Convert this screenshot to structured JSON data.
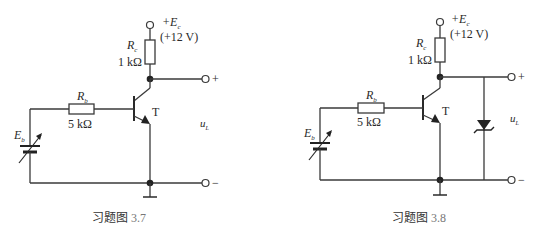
{
  "figures": [
    {
      "id": "3.7",
      "caption_prefix": "习题图",
      "caption_number": "3.7",
      "supply_label": "+E",
      "supply_sub": "c",
      "supply_value": "(+12 V)",
      "rc_label": "R",
      "rc_sub": "c",
      "rc_value": "1 kΩ",
      "rb_label": "R",
      "rb_sub": "b",
      "rb_value": "5 kΩ",
      "transistor_label": "T",
      "source_label": "E",
      "source_sub": "b",
      "output_label": "u",
      "output_sub": "L",
      "plus_terminal": "+",
      "minus_terminal": "−",
      "has_zener": false
    },
    {
      "id": "3.8",
      "caption_prefix": "习题图",
      "caption_number": "3.8",
      "supply_label": "+E",
      "supply_sub": "c",
      "supply_value": "(+12 V)",
      "rc_label": "R",
      "rc_sub": "c",
      "rc_value": "1 kΩ",
      "rb_label": "R",
      "rb_sub": "b",
      "rb_value": "5 kΩ",
      "transistor_label": "T",
      "source_label": "E",
      "source_sub": "b",
      "output_label": "u",
      "output_sub": "L",
      "plus_terminal": "+",
      "minus_terminal": "−",
      "has_zener": true
    }
  ]
}
